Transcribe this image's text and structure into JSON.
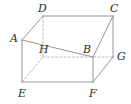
{
  "figure": {
    "type": "geometric-solid-diagram",
    "solid": "rectangular cuboid",
    "projection": "oblique",
    "canvas": {
      "width": 131,
      "height": 104
    },
    "colors": {
      "background": "#ffffff",
      "visible_edge": "#8a8a8a",
      "hidden_edge": "#a9a9a9",
      "label_text": "#2b2b2b"
    },
    "stroke": {
      "visible_width": 0.9,
      "hidden_width": 0.8,
      "hidden_dash": "2.2,2.0"
    }
  },
  "vertices": [
    {
      "id": "A",
      "label": "A",
      "x": 22,
      "y": 40,
      "hidden": false,
      "label_x": 10,
      "label_y": 33
    },
    {
      "id": "B",
      "label": "B",
      "x": 93,
      "y": 57,
      "hidden": false,
      "label_x": 83,
      "label_y": 44
    },
    {
      "id": "C",
      "label": "C",
      "x": 113,
      "y": 16,
      "hidden": false,
      "label_x": 110,
      "label_y": 3
    },
    {
      "id": "D",
      "label": "D",
      "x": 43,
      "y": 16,
      "hidden": false,
      "label_x": 38,
      "label_y": 3
    },
    {
      "id": "E",
      "label": "E",
      "x": 22,
      "y": 82,
      "hidden": false,
      "label_x": 18,
      "label_y": 88
    },
    {
      "id": "F",
      "label": "F",
      "x": 93,
      "y": 82,
      "hidden": false,
      "label_x": 89,
      "label_y": 88
    },
    {
      "id": "G",
      "label": "G",
      "x": 113,
      "y": 57,
      "hidden": false,
      "label_x": 117,
      "label_y": 51
    },
    {
      "id": "H",
      "label": "H",
      "x": 43,
      "y": 57,
      "hidden": true,
      "label_x": 39,
      "label_y": 44
    }
  ],
  "edges": [
    {
      "id": "DC",
      "from": "D",
      "to": "C",
      "hidden": false,
      "name": "edge-d-c"
    },
    {
      "id": "AB",
      "from": "A",
      "to": "B",
      "hidden": false,
      "name": "edge-a-b"
    },
    {
      "id": "AD",
      "from": "A",
      "to": "D",
      "hidden": false,
      "name": "edge-a-d"
    },
    {
      "id": "BC",
      "from": "B",
      "to": "C",
      "hidden": false,
      "name": "edge-b-c"
    },
    {
      "id": "AE",
      "from": "A",
      "to": "E",
      "hidden": false,
      "name": "edge-a-e"
    },
    {
      "id": "BF",
      "from": "B",
      "to": "F",
      "hidden": false,
      "name": "edge-b-f"
    },
    {
      "id": "CG",
      "from": "C",
      "to": "G",
      "hidden": false,
      "name": "edge-c-g"
    },
    {
      "id": "EF",
      "from": "E",
      "to": "F",
      "hidden": false,
      "name": "edge-e-f"
    },
    {
      "id": "FG",
      "from": "F",
      "to": "G",
      "hidden": false,
      "name": "edge-f-g"
    },
    {
      "id": "DH",
      "from": "D",
      "to": "H",
      "hidden": true,
      "name": "edge-d-h"
    },
    {
      "id": "HG",
      "from": "H",
      "to": "G",
      "hidden": true,
      "name": "edge-h-g"
    },
    {
      "id": "EH",
      "from": "E",
      "to": "H",
      "hidden": true,
      "name": "edge-e-h"
    }
  ]
}
